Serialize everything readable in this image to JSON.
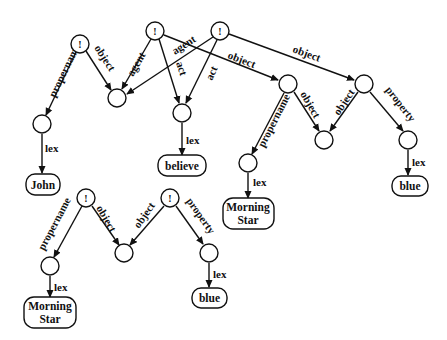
{
  "diagram": {
    "type": "semantic-network",
    "assertion_marker": "!",
    "edge_labels": {
      "propername": "propername",
      "object": "object",
      "agent": "agent",
      "act": "act",
      "property": "property",
      "lex": "lex"
    },
    "lex_boxes": {
      "john": "John",
      "believe": "believe",
      "morning_star_1_line1": "Morning",
      "morning_star_1_line2": "Star",
      "blue_1": "blue",
      "morning_star_2_line1": "Morning",
      "morning_star_2_line2": "Star",
      "blue_2": "blue"
    }
  }
}
